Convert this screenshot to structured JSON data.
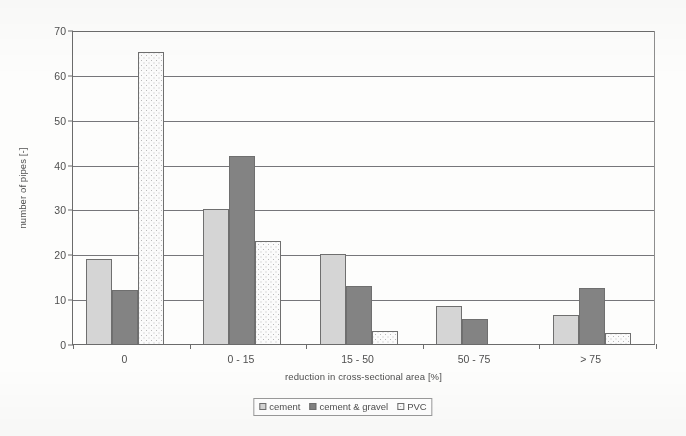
{
  "chart_data": {
    "type": "bar",
    "title": "",
    "subtitle": "",
    "xlabel": "reduction in cross-sectional area [%]",
    "ylabel": "number of pipes [-]",
    "categories": [
      "0",
      "0 - 15",
      "15 - 50",
      "50 - 75",
      "> 75"
    ],
    "series": [
      {
        "name": "cement",
        "color": "#d5d5d5",
        "values": [
          19,
          30,
          20,
          8.5,
          6.5
        ]
      },
      {
        "name": "cement & gravel",
        "color": "#838383",
        "values": [
          12,
          42,
          13,
          5.5,
          12.5
        ]
      },
      {
        "name": "PVC",
        "color": "#fbfbfb",
        "values": [
          65,
          23,
          3,
          0,
          2.5
        ]
      }
    ],
    "ylim": [
      0,
      70
    ],
    "yticks": [
      0,
      10,
      20,
      30,
      40,
      50,
      60,
      70
    ],
    "ytick_labels": [
      "0",
      "10",
      "20",
      "30",
      "40",
      "50",
      "60",
      "70"
    ],
    "grid": "horizontal",
    "legend_position": "bottom"
  },
  "legend": {
    "entries": [
      {
        "label": "cement"
      },
      {
        "label": "cement & gravel"
      },
      {
        "label": "PVC"
      }
    ]
  }
}
